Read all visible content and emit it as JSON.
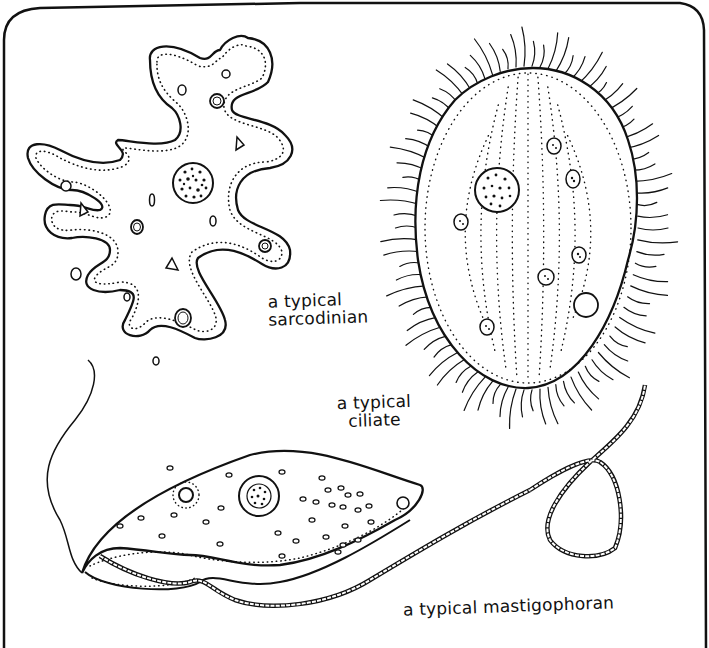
{
  "figure": {
    "type": "hand-drawn biology illustration",
    "frame": "rounded rectangle border",
    "organisms": [
      {
        "id": "sarcodinian",
        "label_line1": "a typical",
        "label_line2": "sarcodinian",
        "description": "amoeba with lobed pseudopods, dotted inner membrane, granular nucleus, vacuoles"
      },
      {
        "id": "ciliate",
        "label_line1": "a typical",
        "label_line2": "ciliate",
        "description": "oval cell covered with cilia, dotted longitudinal rows, macronucleus, vacuoles"
      },
      {
        "id": "mastigophoran",
        "label_line1": "a typical mastigophoran",
        "description": "elongated cell with undulating membrane, nucleus, long looping flagellum"
      }
    ]
  },
  "colors": {
    "ink": "#111111",
    "paper": "#ffffff"
  }
}
